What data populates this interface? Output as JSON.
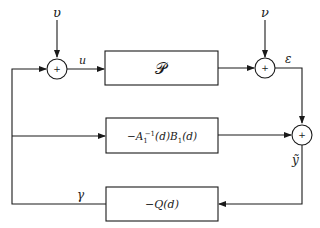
{
  "diagram": {
    "type": "block-diagram",
    "blocks": [
      {
        "id": "plant",
        "label": "𝒫"
      },
      {
        "id": "feedforward",
        "label_main": "−A",
        "label_sub": "1",
        "label_sup": "−1",
        "label_rest": "(d)B",
        "label_sub2": "1",
        "label_tail": "(d)"
      },
      {
        "id": "controller",
        "label": "−Q(d)"
      }
    ],
    "summing_junctions": [
      {
        "id": "sum1",
        "sign": "+"
      },
      {
        "id": "sum2",
        "sign": "+"
      },
      {
        "id": "sum3",
        "sign": "+"
      }
    ],
    "signals": {
      "input_v": "υ",
      "input_nu": "ν",
      "u": "u",
      "epsilon": "ε",
      "y_tilde": "ỹ",
      "gamma": "γ"
    },
    "connections": [
      {
        "from": "υ",
        "to": "sum1"
      },
      {
        "from": "sum1",
        "to": "plant",
        "signal": "u"
      },
      {
        "from": "plant",
        "to": "sum2"
      },
      {
        "from": "ν",
        "to": "sum2"
      },
      {
        "from": "sum2",
        "to": "sum3",
        "signal": "ε"
      },
      {
        "from": "feedforward",
        "to": "sum3"
      },
      {
        "from": "sum3",
        "to": "controller",
        "signal": "ỹ"
      },
      {
        "from": "controller",
        "to": "sum1",
        "signal": "γ"
      },
      {
        "from": "γ-line",
        "to": "feedforward"
      }
    ]
  }
}
